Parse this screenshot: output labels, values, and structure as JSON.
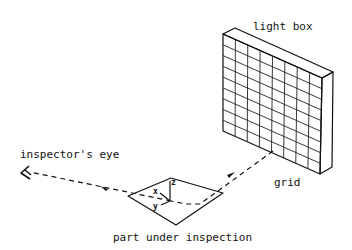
{
  "diagram": {
    "labels": {
      "light_box": "light box",
      "grid": "grid",
      "inspector_eye": "inspector's eye",
      "part": "part under inspection"
    },
    "axes": {
      "x": "x",
      "y": "y",
      "z": "z"
    },
    "grid": {
      "columns": 8,
      "rows": 9
    }
  }
}
